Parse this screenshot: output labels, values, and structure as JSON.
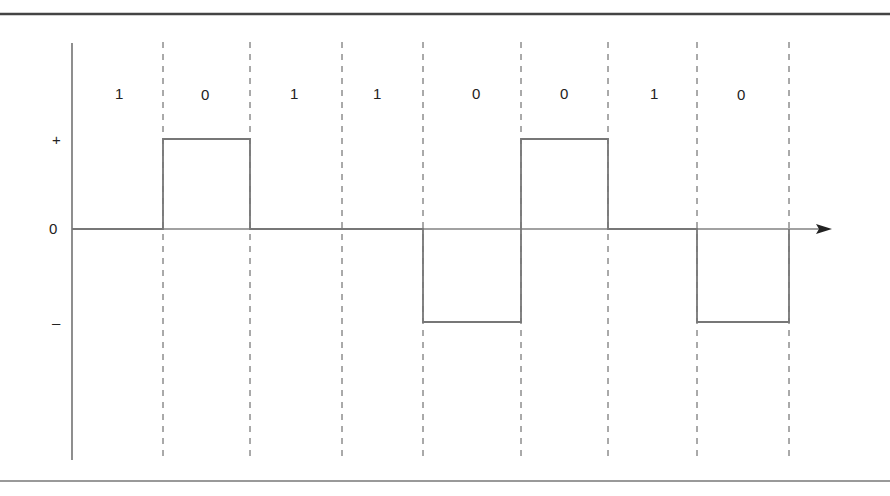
{
  "diagram": {
    "bits": [
      "1",
      "0",
      "1",
      "1",
      "0",
      "0",
      "1",
      "0"
    ],
    "levels": {
      "plus": "+",
      "zero": "0",
      "minus": "–"
    },
    "signal": [
      "0",
      "+",
      "0",
      "0",
      "-",
      "+",
      "0",
      "-"
    ],
    "colors": {
      "axis": "#333333",
      "signal": "#777777",
      "dash": "#555555",
      "border": "#444444"
    }
  }
}
